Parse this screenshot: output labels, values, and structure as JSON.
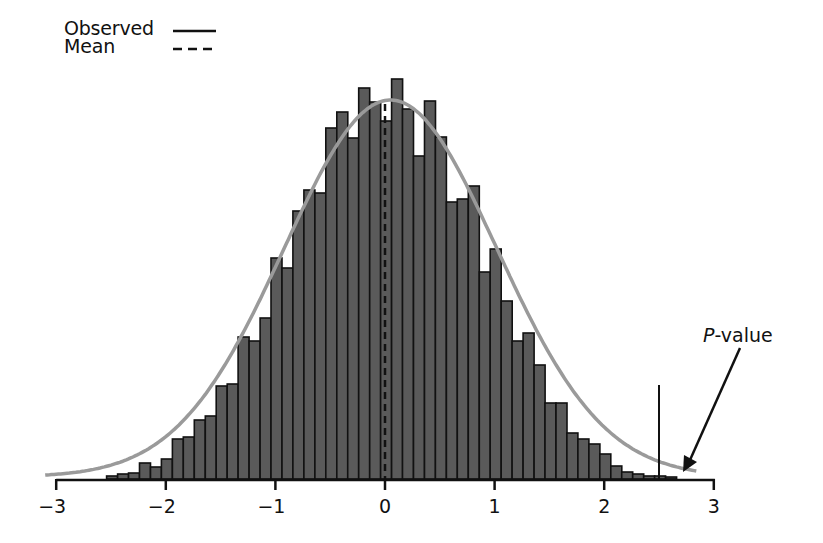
{
  "legend": {
    "observed_label": "Observed",
    "mean_label": "Mean"
  },
  "annotation": {
    "p_letter": "P",
    "p_suffix": "-value"
  },
  "colors": {
    "bar_fill": "#5a5a5a",
    "bar_stroke": "#111111",
    "curve": "#9a9a9a",
    "axis": "#111111"
  },
  "chart_data": {
    "type": "bar",
    "subtype": "histogram_with_normal_curve",
    "title": "",
    "xlabel": "",
    "ylabel": "",
    "xlim": [
      -3,
      3
    ],
    "x_ticks": [
      -3,
      -2,
      -1,
      0,
      1,
      2,
      3
    ],
    "x_tick_labels": [
      "−3",
      "−2",
      "−1",
      "0",
      "1",
      "2",
      "3"
    ],
    "grid": false,
    "legend_position": "top-left",
    "legend": [
      {
        "label": "Observed",
        "style": "solid line"
      },
      {
        "label": "Mean",
        "style": "dashed line"
      }
    ],
    "bin_width": 0.1,
    "bin_left_edges": [
      -2.54,
      -2.44,
      -2.34,
      -2.24,
      -2.14,
      -2.04,
      -1.94,
      -1.84,
      -1.74,
      -1.64,
      -1.54,
      -1.44,
      -1.34,
      -1.24,
      -1.14,
      -1.04,
      -0.94,
      -0.84,
      -0.74,
      -0.64,
      -0.54,
      -0.44,
      -0.34,
      -0.24,
      -0.14,
      -0.04,
      0.06,
      0.16,
      0.26,
      0.36,
      0.46,
      0.56,
      0.66,
      0.76,
      0.86,
      0.96,
      1.06,
      1.16,
      1.26,
      1.36,
      1.46,
      1.56,
      1.66,
      1.76,
      1.86,
      1.96,
      2.06,
      2.16,
      2.26,
      2.36,
      2.46,
      2.56
    ],
    "values": [
      3,
      5,
      6,
      16,
      12,
      20,
      40,
      42,
      59,
      63,
      93,
      95,
      142,
      138,
      161,
      221,
      211,
      268,
      289,
      286,
      351,
      367,
      341,
      391,
      377,
      358,
      400,
      370,
      323,
      378,
      342,
      277,
      280,
      293,
      207,
      230,
      178,
      138,
      146,
      114,
      76,
      76,
      46,
      40,
      35,
      25,
      13,
      7,
      5,
      3,
      3,
      2
    ],
    "value_units": "relative frequency (pixel-height scale, peak ≈ 400)",
    "normal_curve": {
      "mean": 0.05,
      "sd": 0.97,
      "peak": 377
    },
    "observed_value": 2.5,
    "mean_value": 0.0,
    "annotations": [
      {
        "text": "P-value",
        "points_to": "right tail area beyond observed value"
      }
    ]
  }
}
